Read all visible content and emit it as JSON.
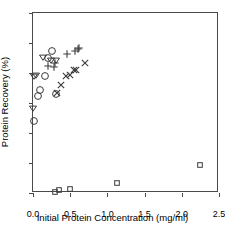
{
  "chart_data": {
    "type": "scatter",
    "title": "",
    "xlabel": "Initial Protein Concentration  (mg/ml)",
    "ylabel": "Protein Recovery (%)",
    "xlim": [
      0.0,
      2.5
    ],
    "ylim": [
      0,
      120
    ],
    "xticks": [
      "0.0",
      "0.5",
      "1.0",
      "1.5",
      "2.0",
      "2.5"
    ],
    "xtick_values": [
      0.0,
      0.5,
      1.0,
      1.5,
      2.0,
      2.5
    ],
    "yticks": [
      "0",
      "20",
      "40",
      "60",
      "80",
      "100",
      "120"
    ],
    "ytick_values": [
      0,
      20,
      40,
      60,
      80,
      100,
      120
    ],
    "grid": false,
    "legend": "none",
    "marker_color": "#3a3a3a",
    "axis_color": "#4a4a4a",
    "series": [
      {
        "name": "circle",
        "marker": "circle",
        "points": [
          {
            "x": 0.01,
            "y": 48
          },
          {
            "x": 0.07,
            "y": 65
          },
          {
            "x": 0.1,
            "y": 69
          },
          {
            "x": 0.16,
            "y": 78
          },
          {
            "x": 0.2,
            "y": 90
          },
          {
            "x": 0.26,
            "y": 95
          },
          {
            "x": 0.31,
            "y": 66
          }
        ]
      },
      {
        "name": "triangle-down",
        "marker": "triangle-down",
        "points": [
          {
            "x": 0.0,
            "y": 57
          },
          {
            "x": 0.02,
            "y": 78
          },
          {
            "x": 0.04,
            "y": 79
          },
          {
            "x": 0.13,
            "y": 91
          },
          {
            "x": 0.24,
            "y": 89
          },
          {
            "x": 0.31,
            "y": 89
          }
        ]
      },
      {
        "name": "plus",
        "marker": "plus",
        "points": [
          {
            "x": 0.2,
            "y": 85
          },
          {
            "x": 0.28,
            "y": 84
          },
          {
            "x": 0.29,
            "y": 87
          },
          {
            "x": 0.46,
            "y": 93
          },
          {
            "x": 0.56,
            "y": 95
          },
          {
            "x": 0.6,
            "y": 96
          },
          {
            "x": 0.62,
            "y": 97
          }
        ]
      },
      {
        "name": "cross",
        "marker": "cross",
        "points": [
          {
            "x": 0.32,
            "y": 67
          },
          {
            "x": 0.37,
            "y": 72
          },
          {
            "x": 0.45,
            "y": 78
          },
          {
            "x": 0.5,
            "y": 79
          },
          {
            "x": 0.55,
            "y": 82
          },
          {
            "x": 0.58,
            "y": 82
          },
          {
            "x": 0.7,
            "y": 87
          }
        ]
      },
      {
        "name": "square",
        "marker": "square",
        "points": [
          {
            "x": 0.29,
            "y": 1
          },
          {
            "x": 0.35,
            "y": 2
          },
          {
            "x": 0.5,
            "y": 3
          },
          {
            "x": 1.13,
            "y": 7
          },
          {
            "x": 2.25,
            "y": 19
          }
        ]
      }
    ]
  }
}
